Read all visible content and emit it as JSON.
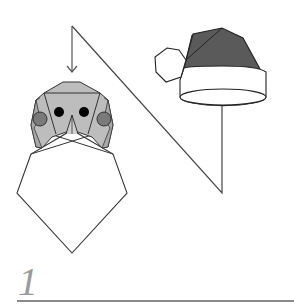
{
  "diagram": {
    "step_number": "1",
    "parts": [
      "santa-face",
      "beard",
      "santa-hat",
      "pompom",
      "hat-brim",
      "assembly-arrow",
      "guide-line"
    ],
    "colors": {
      "face_fill": "#bdbdbd",
      "cheek_fill": "#7a7a7a",
      "hat_fill": "#5a5a5a",
      "outline": "#333333",
      "step_number": "#9a9a9a",
      "rule": "#8a8a8a"
    }
  }
}
